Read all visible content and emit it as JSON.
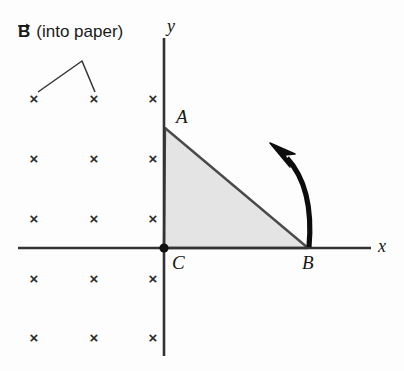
{
  "figure": {
    "kind": "physics-diagram",
    "background_color": "#fdfdfd",
    "width": 404,
    "height": 371
  },
  "field": {
    "symbol": "B",
    "note": "(into paper)",
    "marker_glyph": "×",
    "marker_color": "#2b2b2b",
    "columns_x": [
      34,
      94,
      153
    ],
    "rows_y": [
      98,
      158,
      218,
      278,
      337
    ],
    "leader": {
      "apex_x": 82,
      "apex_y": 61,
      "left_end_x": 38,
      "left_end_y": 92,
      "right_end_x": 95,
      "right_end_y": 92,
      "color": "#333333"
    },
    "label_x": 18,
    "label_y": 30
  },
  "axes": {
    "color": "#333333",
    "x_label": "x",
    "y_label": "y",
    "x_start": 18,
    "x_end": 371,
    "y_top": 38,
    "y_bottom": 356,
    "origin_x": 164,
    "origin_y": 248,
    "x_label_pos": {
      "x": 378,
      "y": 236
    },
    "y_label_pos": {
      "x": 167,
      "y": 16
    }
  },
  "triangle": {
    "fill_color": "#e4e4e4",
    "edge_color": "#4a4a4a",
    "vertices": [
      {
        "label": "A",
        "x": 165,
        "y": 127,
        "label_x": 176,
        "label_y": 106
      },
      {
        "label": "B",
        "x": 308,
        "y": 248,
        "label_x": 302,
        "label_y": 252
      },
      {
        "label": "C",
        "x": 164,
        "y": 248,
        "label_x": 172,
        "label_y": 252
      }
    ],
    "origin_dot_color": "#111111"
  },
  "rotation_arrow": {
    "color": "#0d0d0d",
    "description": "counterclockwise-rotation-arrow",
    "tail": {
      "x": 309,
      "y": 247
    },
    "head": {
      "x": 271,
      "y": 150
    }
  }
}
